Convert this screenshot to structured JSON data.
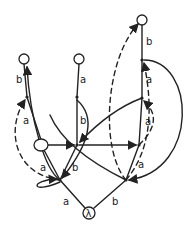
{
  "diagram": {
    "type": "automaton-tree",
    "style": "hand-drawn",
    "root_label": "λ",
    "nodes": [
      {
        "id": "root",
        "label": "λ",
        "kind": "circle",
        "x": 89,
        "y": 213
      },
      {
        "id": "L",
        "kind": "dot",
        "x": 60,
        "y": 180
      },
      {
        "id": "R",
        "kind": "dot",
        "x": 126,
        "y": 180
      },
      {
        "id": "O1",
        "kind": "circle",
        "x": 41,
        "y": 145
      },
      {
        "id": "M",
        "kind": "dot",
        "x": 77,
        "y": 145
      },
      {
        "id": "RM",
        "kind": "dot",
        "x": 139,
        "y": 145
      },
      {
        "id": "LU",
        "kind": "dot",
        "x": 27,
        "y": 97
      },
      {
        "id": "CU",
        "kind": "dot",
        "x": 77,
        "y": 97
      },
      {
        "id": "RU",
        "kind": "dot",
        "x": 142,
        "y": 98
      },
      {
        "id": "RT",
        "kind": "dot",
        "x": 142,
        "y": 60
      },
      {
        "id": "TL",
        "kind": "circle",
        "x": 24,
        "y": 59
      },
      {
        "id": "TC",
        "kind": "circle",
        "x": 79,
        "y": 59
      },
      {
        "id": "TR",
        "kind": "circle",
        "x": 142,
        "y": 20
      }
    ],
    "edge_labels": {
      "root_L": "a",
      "root_R": "b",
      "L_O1": "a",
      "L_M": "b",
      "R_RM": "a",
      "O1_LU": "a",
      "LU_TL": "b",
      "M_CU": "b",
      "CU_TC": "a",
      "RM_RU": "a",
      "RU_RT": "a",
      "RT_TR": "b"
    },
    "colors": {
      "ink": "#222222",
      "background": "#ffffff"
    }
  }
}
